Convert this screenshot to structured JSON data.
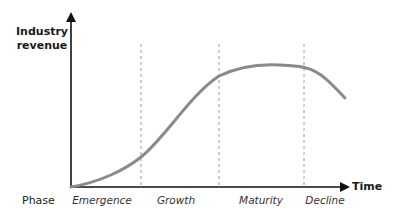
{
  "diagram": {
    "type": "industry-life-cycle",
    "y_axis_label_line1": "Industry",
    "y_axis_label_line2": "revenue",
    "x_axis_label": "Time",
    "phase_label": "Phase",
    "phases": [
      {
        "name": "Emergence",
        "center_x": 102
      },
      {
        "name": "Growth",
        "center_x": 176
      },
      {
        "name": "Maturity",
        "center_x": 261
      },
      {
        "name": "Decline",
        "center_x": 325
      }
    ],
    "phase_boundaries_x": [
      141,
      219,
      304
    ],
    "colors": {
      "curve": "#8a8a8a",
      "axis": "#111111",
      "divider": "#9a9a9a"
    }
  }
}
